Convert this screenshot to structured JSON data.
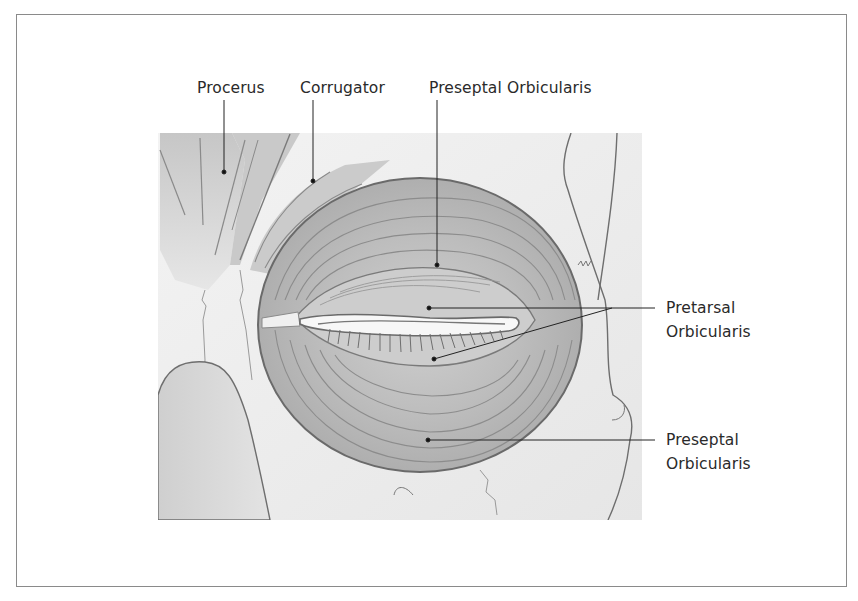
{
  "figure": {
    "colors": {
      "muscle_fill": "#b9b9b9",
      "muscle_dark": "#9a9a9a",
      "outline": "#6e6e6e",
      "skin_fill": "#eeeeee",
      "leader_line": "#222222",
      "frame_border": "#8a8a8a",
      "text": "#2a2a2a"
    }
  },
  "labels": {
    "procerus": "Procerus",
    "corrugator": "Corrugator",
    "preseptal_top": "Preseptal Orbicularis",
    "pretarsal_line1": "Pretarsal",
    "pretarsal_line2": "Orbicularis",
    "preseptal_bottom_line1": "Preseptal",
    "preseptal_bottom_line2": "Orbicularis"
  },
  "leaders": [
    {
      "label": "Procerus",
      "from": [
        224,
        100
      ],
      "to": [
        224,
        172
      ]
    },
    {
      "label": "Corrugator",
      "from": [
        313,
        100
      ],
      "to": [
        313,
        181
      ]
    },
    {
      "label": "Preseptal Orbicularis (upper)",
      "from": [
        437,
        100
      ],
      "to": [
        437,
        265
      ]
    },
    {
      "label": "Pretarsal Orbicularis (upper lid)",
      "from": [
        655,
        308
      ],
      "to": [
        429,
        308
      ]
    },
    {
      "label": "Pretarsal Orbicularis (lower lid)",
      "from": [
        612,
        308
      ],
      "to": [
        434,
        359
      ]
    },
    {
      "label": "Preseptal Orbicularis (lower)",
      "from": [
        655,
        440
      ],
      "to": [
        428,
        440
      ]
    }
  ]
}
